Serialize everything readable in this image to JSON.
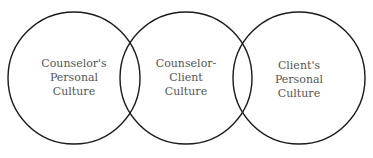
{
  "diagram": {
    "stroke_color": "#1a1a1a",
    "circles": [
      {
        "id": "counselor",
        "cx": 74,
        "cy": 78,
        "r": 66,
        "lines": [
          "Counselor's",
          "Personal",
          "Culture"
        ]
      },
      {
        "id": "shared",
        "cx": 186,
        "cy": 78,
        "r": 66,
        "lines": [
          "Counselor-",
          "Client",
          "Culture"
        ]
      },
      {
        "id": "client",
        "cx": 299,
        "cy": 78,
        "r": 66,
        "lines": [
          "Client's",
          "Personal",
          "Culture"
        ]
      }
    ]
  }
}
